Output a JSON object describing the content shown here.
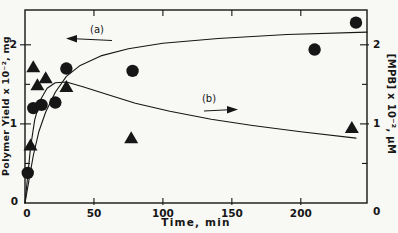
{
  "figure": {
    "background": "#f8f8f5",
    "ink": "#161616"
  },
  "chart_data": {
    "type": "scatter",
    "title": "",
    "xlabel": "Time, min",
    "ylabel_left": "Polymer Yield x 10⁻², mg",
    "ylabel_right": "[MPB] x 10⁻², μM",
    "xlim": [
      0,
      248
    ],
    "ylim_left": [
      0,
      2.44
    ],
    "ylim_right": [
      0,
      2.44
    ],
    "grid": false,
    "legend": "none",
    "x_ticks": [
      {
        "value": 50,
        "label": "50"
      },
      {
        "value": 100,
        "label": "100"
      },
      {
        "value": 150,
        "label": "150"
      },
      {
        "value": 200,
        "label": "200"
      }
    ],
    "y_ticks_major": [
      {
        "value": 1,
        "label": "1"
      },
      {
        "value": 2,
        "label": "2"
      }
    ],
    "y_ticks_minor": [
      0.5,
      1.5
    ],
    "origin_labels": {
      "left_axis_zero": "0",
      "x_axis_zero": "0",
      "right_axis_zero": "0"
    },
    "series": [
      {
        "name": "polymer-yield",
        "marker": "circle",
        "axis": "left",
        "curve_label": "(a)",
        "points": [
          [
            2,
            0.38
          ],
          [
            6,
            1.2
          ],
          [
            12,
            1.24
          ],
          [
            22,
            1.27
          ],
          [
            30,
            1.7
          ],
          [
            78,
            1.67
          ],
          [
            210,
            1.94
          ],
          [
            240,
            2.28
          ]
        ]
      },
      {
        "name": "mpb-concentration",
        "marker": "triangle",
        "axis": "right",
        "curve_label": "(b)",
        "points": [
          [
            4,
            0.73
          ],
          [
            6,
            1.72
          ],
          [
            9,
            1.49
          ],
          [
            15,
            1.58
          ],
          [
            30,
            1.47
          ],
          [
            77,
            0.82
          ],
          [
            237,
            0.95
          ]
        ]
      }
    ],
    "curves": [
      {
        "label": "(a)",
        "points": [
          [
            0,
            0
          ],
          [
            3,
            0.3
          ],
          [
            6,
            0.6
          ],
          [
            10,
            0.9
          ],
          [
            15,
            1.15
          ],
          [
            22,
            1.4
          ],
          [
            30,
            1.6
          ],
          [
            40,
            1.74
          ],
          [
            55,
            1.86
          ],
          [
            75,
            1.95
          ],
          [
            100,
            2.02
          ],
          [
            140,
            2.08
          ],
          [
            190,
            2.13
          ],
          [
            248,
            2.16
          ]
        ]
      },
      {
        "label": "(b)",
        "points": [
          [
            0,
            0
          ],
          [
            2,
            0.35
          ],
          [
            4,
            0.7
          ],
          [
            7,
            1.05
          ],
          [
            11,
            1.3
          ],
          [
            16,
            1.45
          ],
          [
            22,
            1.52
          ],
          [
            30,
            1.53
          ],
          [
            42,
            1.47
          ],
          [
            58,
            1.38
          ],
          [
            80,
            1.26
          ],
          [
            105,
            1.16
          ],
          [
            135,
            1.06
          ],
          [
            165,
            0.98
          ],
          [
            200,
            0.9
          ],
          [
            240,
            0.82
          ]
        ]
      }
    ],
    "annotations": [
      {
        "label": "(a)",
        "arrow_direction": "left"
      },
      {
        "label": "(b)",
        "arrow_direction": "right"
      }
    ]
  }
}
